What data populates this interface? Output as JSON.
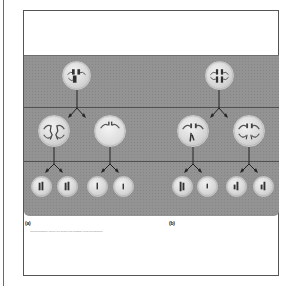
{
  "figure": {
    "panels": [
      {
        "id": "a",
        "label": "(a)"
      },
      {
        "id": "b",
        "label": "(b)"
      }
    ],
    "caption": "meiosis diagram: parent cell divides into daughter cells and gametes",
    "colors": {
      "band": "#8e8e8e",
      "divider": "#505050",
      "cell_fill": "#d8d8d8",
      "chromosome": "#3a3a3a",
      "frame_border": "#555555"
    },
    "rows": [
      {
        "name": "parent-cells",
        "cells": [
          {
            "panel": "a",
            "x": 76,
            "y": 75,
            "r": 14
          },
          {
            "panel": "b",
            "x": 219,
            "y": 75,
            "r": 14
          }
        ]
      },
      {
        "name": "first-division",
        "cells": [
          {
            "panel": "a",
            "x": 54,
            "y": 131,
            "r": 15
          },
          {
            "panel": "a",
            "x": 110,
            "y": 131,
            "r": 15
          },
          {
            "panel": "b",
            "x": 193,
            "y": 131,
            "r": 15
          },
          {
            "panel": "b",
            "x": 249,
            "y": 131,
            "r": 15
          }
        ]
      },
      {
        "name": "gametes",
        "cells": [
          {
            "panel": "a",
            "x": 41,
            "y": 186,
            "r": 10
          },
          {
            "panel": "a",
            "x": 67,
            "y": 186,
            "r": 10
          },
          {
            "panel": "a",
            "x": 97,
            "y": 186,
            "r": 10
          },
          {
            "panel": "a",
            "x": 123,
            "y": 186,
            "r": 10
          },
          {
            "panel": "b",
            "x": 182,
            "y": 186,
            "r": 10
          },
          {
            "panel": "b",
            "x": 207,
            "y": 186,
            "r": 10
          },
          {
            "panel": "b",
            "x": 236,
            "y": 186,
            "r": 10
          },
          {
            "panel": "b",
            "x": 263,
            "y": 186,
            "r": 10
          }
        ]
      }
    ]
  }
}
